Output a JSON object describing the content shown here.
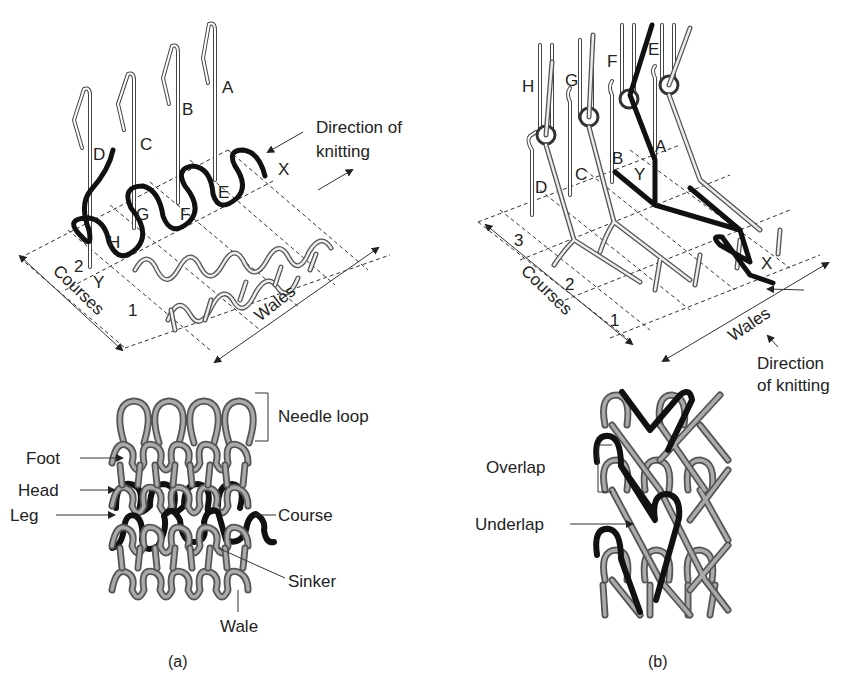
{
  "panel_a": {
    "caption": "(a)",
    "needles": [
      "A",
      "B",
      "C",
      "D"
    ],
    "loops": [
      "E",
      "F",
      "G",
      "H"
    ],
    "markers": {
      "x": "X",
      "y": "Y"
    },
    "course_numbers": [
      "1",
      "2"
    ],
    "axis_courses": "Courses",
    "axis_wales": "Wales",
    "direction_line1": "Direction of",
    "direction_line2": "knitting",
    "fabric_labels": {
      "needle_loop": "Needle loop",
      "foot": "Foot",
      "head": "Head",
      "leg": "Leg",
      "course": "Course",
      "sinker": "Sinker",
      "wale": "Wale"
    }
  },
  "panel_b": {
    "caption": "(b)",
    "guides": [
      "E",
      "F",
      "G",
      "H"
    ],
    "needles": [
      "A",
      "B",
      "C",
      "D"
    ],
    "markers": {
      "x": "X",
      "y": "Y"
    },
    "course_numbers": [
      "1",
      "2",
      "3"
    ],
    "axis_courses": "Courses",
    "axis_wales": "Wales",
    "direction_line1": "Direction",
    "direction_line2": "of knitting",
    "fabric_labels": {
      "overlap": "Overlap",
      "underlap": "Underlap"
    }
  },
  "colors": {
    "yarn_dark": "#111111",
    "yarn_light": "#aaaaaa",
    "outline": "#555555",
    "background": "#ffffff"
  }
}
